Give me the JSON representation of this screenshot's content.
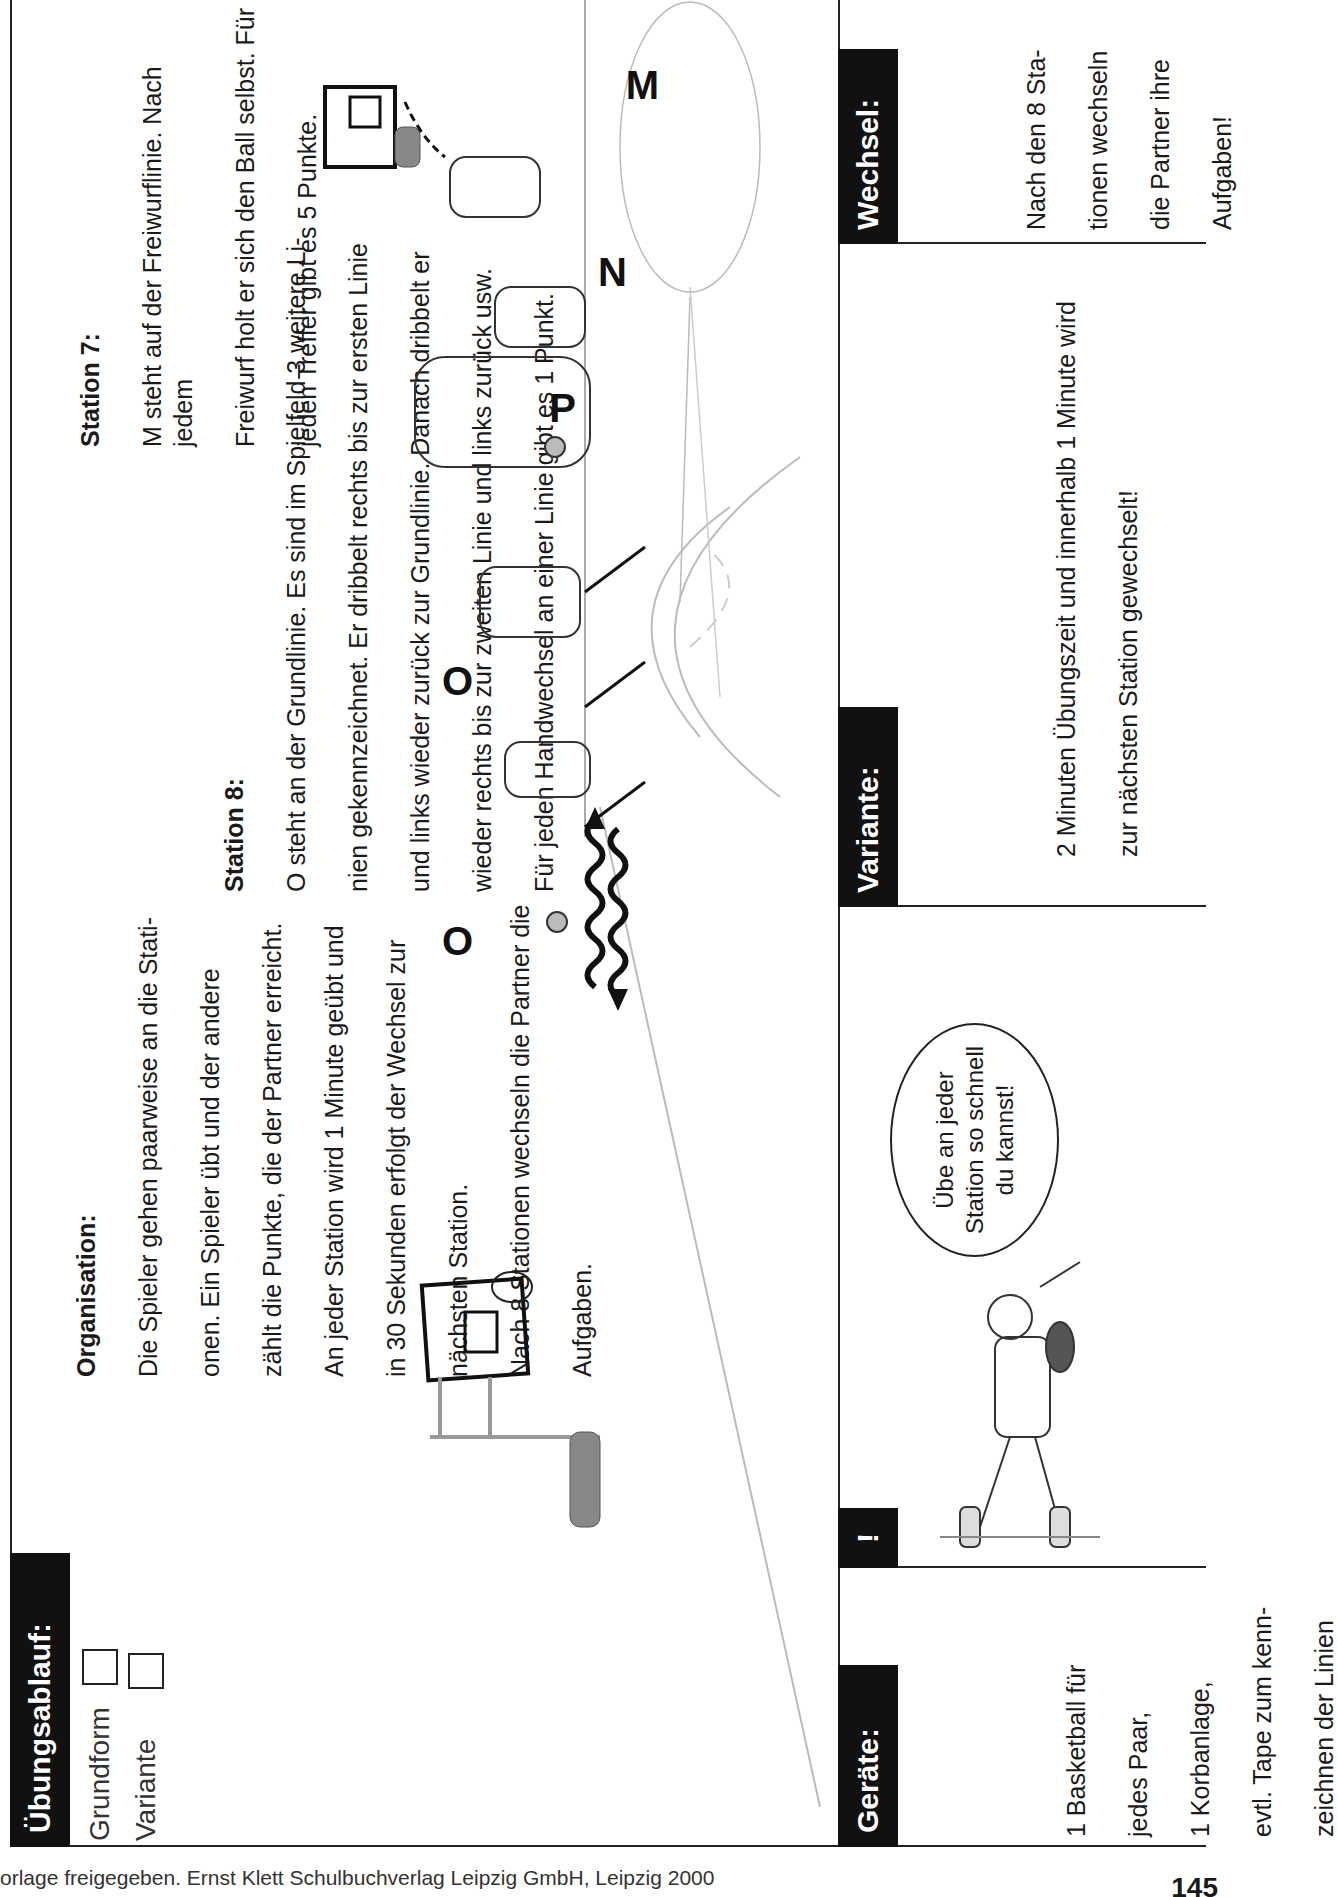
{
  "header": {
    "title": "Übungsablauf:",
    "options": [
      {
        "label": "Grundform",
        "checked": false
      },
      {
        "label": "Variante",
        "checked": false
      }
    ]
  },
  "organisation": {
    "heading": "Organisation:",
    "lines": [
      "Die Spieler gehen paarweise an die Stati-",
      "onen. Ein Spieler übt und der andere",
      "zählt die Punkte, die der Partner erreicht.",
      "An jeder Station wird 1 Minute geübt und",
      "in 30 Sekunden erfolgt der Wechsel zur",
      "nächsten Station.",
      "Nach 8 Stationen wechseln die Partner die",
      "Aufgaben."
    ]
  },
  "station8": {
    "heading": "Station 8:",
    "lines": [
      "O steht an der Grundlinie. Es sind im Spielfeld 3 weitere Li-",
      "nien gekennzeichnet. Er dribbelt rechts bis zur ersten Linie",
      "und links wieder zurück zur Grundlinie. Danach dribbelt er",
      "wieder rechts bis zur zweiten Linie und links zurück usw.",
      "Für jeden Handwechsel an einer Linie gibt es 1 Punkt."
    ]
  },
  "station7": {
    "heading": "Station 7:",
    "lines": [
      "M steht auf der Freiwurflinie. Nach jedem",
      "Freiwurf holt er sich den Ball selbst. Für",
      "jeden Treffer gibt es 5 Punkte."
    ]
  },
  "illustration": {
    "player_labels": [
      "O",
      "O",
      "P",
      "N",
      "M"
    ]
  },
  "panels": {
    "geraete": {
      "title": "Geräte:",
      "lines": [
        "1 Basketball für",
        "jedes Paar,",
        "1 Korbanlage,",
        "evtl. Tape zum kenn-",
        "zeichnen der Linien"
      ]
    },
    "hinweis": {
      "title": "!",
      "speech_lines": [
        "Übe an jeder",
        "Station so schnell",
        "du kannst!"
      ]
    },
    "variante": {
      "title": "Variante:",
      "lines": [
        "2 Minuten Übungszeit und innerhalb 1 Minute wird",
        "zur nächsten Station gewechselt!"
      ]
    },
    "wechsel": {
      "title": "Wechsel:",
      "lines": [
        "Nach den 8 Sta-",
        "tionen wechseln",
        "die Partner ihre",
        "Aufgaben!"
      ]
    }
  },
  "footer": {
    "text": "orlage freigegeben. Ernst Klett Schulbuchverlag Leipzig GmbH, Leipzig 2000",
    "page_number": "145"
  }
}
